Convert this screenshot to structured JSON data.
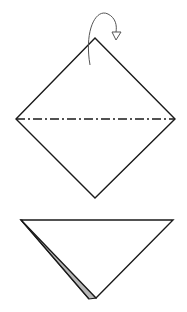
{
  "diagram": {
    "type": "origami-instructions",
    "steps": [
      {
        "name": "step-square-valley-fold",
        "shape": "diamond",
        "vertices": {
          "top": [
            95,
            38
          ],
          "right": [
            175,
            119
          ],
          "bottom": [
            95,
            198
          ],
          "left": [
            16,
            119
          ]
        },
        "fold_line": {
          "style": "dash-dot",
          "from": [
            16,
            119
          ],
          "to": [
            175,
            119
          ]
        },
        "arrow": {
          "type": "fold-behind",
          "path": "M90 65 C 84 30, 96 8, 108 14 C 116 18, 117 26, 116 32",
          "head": [
            [
              112,
              32
            ],
            [
              121,
              32
            ],
            [
              116,
              40
            ]
          ]
        }
      },
      {
        "name": "step-folded-triangle",
        "shape": "triangle",
        "vertices": {
          "top_left": [
            21,
            220
          ],
          "top_right": [
            173,
            220
          ],
          "bottom": [
            96,
            298
          ]
        },
        "flap": {
          "color": "#b8b8b8",
          "points": [
            [
              21,
              220
            ],
            [
              89,
              299
            ],
            [
              96,
              298
            ],
            [
              24,
              221
            ]
          ]
        }
      }
    ],
    "colors": {
      "line": "#1a1a1a",
      "arrow": "#555555",
      "flap": "#b8b8b8",
      "background": "#ffffff"
    }
  }
}
